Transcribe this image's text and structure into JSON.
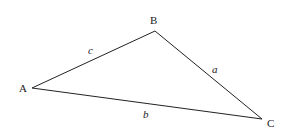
{
  "diagram": {
    "type": "triangle",
    "vertices": [
      {
        "id": "A",
        "label": "A",
        "x": 32,
        "y": 88,
        "label_x": 19,
        "label_y": 92
      },
      {
        "id": "B",
        "label": "B",
        "x": 155,
        "y": 31,
        "label_x": 150,
        "label_y": 24
      },
      {
        "id": "C",
        "label": "C",
        "x": 262,
        "y": 119,
        "label_x": 267,
        "label_y": 127
      }
    ],
    "sides": [
      {
        "id": "a",
        "label": "a",
        "from": "B",
        "to": "C",
        "label_x": 212,
        "label_y": 73
      },
      {
        "id": "b",
        "label": "b",
        "from": "A",
        "to": "C",
        "label_x": 143,
        "label_y": 118
      },
      {
        "id": "c",
        "label": "c",
        "from": "A",
        "to": "B",
        "label_x": 88,
        "label_y": 54
      }
    ],
    "stroke_color": "#222222"
  }
}
